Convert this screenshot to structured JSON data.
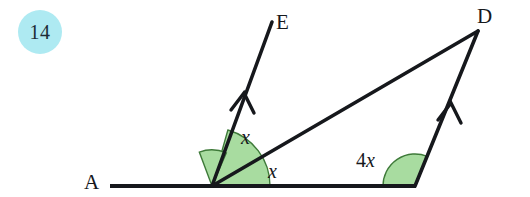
{
  "question": {
    "number": "14",
    "badge_color": "#aeeaf2"
  },
  "diagram": {
    "type": "geometry-angles",
    "stroke_color": "#16181c",
    "sector_fill": "#a8dca0",
    "sector_stroke": "#3e7a39",
    "points": [
      {
        "name": "A",
        "label": "A",
        "x": 110,
        "y": 186
      },
      {
        "name": "B",
        "label": "",
        "x": 212,
        "y": 186
      },
      {
        "name": "C",
        "label": "",
        "x": 415,
        "y": 186
      },
      {
        "name": "D",
        "label": "D",
        "x": 478,
        "y": 31
      },
      {
        "name": "E",
        "label": "E",
        "x": 272,
        "y": 22
      }
    ],
    "segments": [
      {
        "name": "baseline-AC",
        "from": "A",
        "to": "C"
      },
      {
        "name": "ray-BE",
        "from": "B",
        "to": "E",
        "arrow_mark": true
      },
      {
        "name": "ray-CD",
        "from": "C",
        "to": "D",
        "arrow_mark": true
      },
      {
        "name": "transversal-BD",
        "from": "B",
        "to": "D",
        "arrow_mark": false
      }
    ],
    "parallel_marks": [
      {
        "name": "arrow-mark-BE",
        "x": 243,
        "y": 96
      },
      {
        "name": "arrow-mark-CD",
        "x": 450,
        "y": 106
      }
    ],
    "angles": [
      {
        "name": "angle-EBD",
        "label": "x",
        "coefficient": "",
        "variable": "x",
        "vertex": "B",
        "radius": 36
      },
      {
        "name": "angle-DBA-interior",
        "label": "x",
        "coefficient": "",
        "variable": "x",
        "vertex": "B",
        "radius": 58
      },
      {
        "name": "angle-DCA",
        "label": "4x",
        "coefficient": "4",
        "variable": "x",
        "vertex": "C",
        "radius": 32
      }
    ]
  }
}
